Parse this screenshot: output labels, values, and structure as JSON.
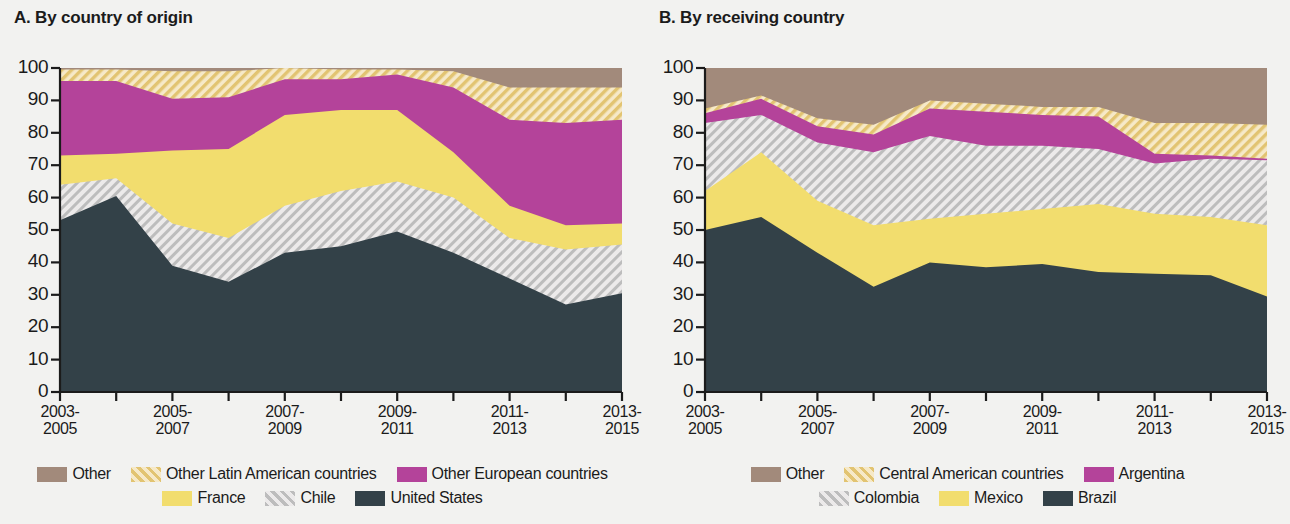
{
  "panels": [
    {
      "id": "A",
      "title": "A. By country of origin",
      "legend_rows": [
        [
          {
            "label": "Other",
            "key": "other"
          },
          {
            "label": "Other Latin American countries",
            "key": "other_latin"
          },
          {
            "label": "Other European countries",
            "key": "other_europe"
          }
        ],
        [
          {
            "label": "France",
            "key": "france"
          },
          {
            "label": "Chile",
            "key": "chile"
          },
          {
            "label": "United States",
            "key": "united_states"
          }
        ]
      ]
    },
    {
      "id": "B",
      "title": "B. By receiving country",
      "legend_rows": [
        [
          {
            "label": "Other",
            "key": "other"
          },
          {
            "label": "Central American countries",
            "key": "central_american"
          },
          {
            "label": "Argentina",
            "key": "argentina"
          }
        ],
        [
          {
            "label": "Colombia",
            "key": "colombia"
          },
          {
            "label": "Mexico",
            "key": "mexico"
          },
          {
            "label": "Brazil",
            "key": "brazil"
          }
        ]
      ]
    }
  ],
  "colors": {
    "brown": "#a28a7b",
    "yellow_hatch_bg": "#f6e9c8",
    "yellow_hatch_line": "#e2c472",
    "magenta": "#b4439a",
    "yellow": "#f2dd6e",
    "gray_hatch_bg": "#eceaea",
    "gray_hatch_line": "#bdbdbd",
    "dark": "#334148",
    "axis": "#1b1b1b",
    "background": "#f2f2f0"
  },
  "axis": {
    "y_ticks": [
      "100",
      "90",
      "80",
      "70",
      "60",
      "50",
      "40",
      "30",
      "20",
      "10",
      "0"
    ],
    "x_labels": [
      "2003-\n2005",
      "2005-\n2007",
      "2007-\n2009",
      "2009-\n2011",
      "2011-\n2013",
      "2013-\n2015"
    ],
    "x_labels_line1": [
      "2003-",
      "2005-",
      "2007-",
      "2009-",
      "2011-",
      "2013-"
    ],
    "x_labels_line2": [
      "2005",
      "2007",
      "2009",
      "2011",
      "2013",
      "2015"
    ],
    "ylim": [
      0,
      100
    ],
    "n_points": 11
  },
  "chart_data": [
    {
      "type": "area",
      "title": "A. By country of origin",
      "xlabel": "",
      "ylabel": "",
      "ylim": [
        0,
        100
      ],
      "grid": false,
      "stacked": true,
      "legend_position": "bottom",
      "categories": [
        "2003-2005",
        "2004-2006",
        "2005-2007",
        "2006-2008",
        "2007-2009",
        "2008-2010",
        "2009-2011",
        "2010-2012",
        "2011-2013",
        "2012-2014",
        "2013-2015"
      ],
      "x_tick_labels": [
        "2003-2005",
        "2005-2007",
        "2007-2009",
        "2009-2011",
        "2011-2013",
        "2013-2015"
      ],
      "series": [
        {
          "name": "United States",
          "key": "united_states",
          "values": [
            53,
            60.5,
            39,
            34,
            43,
            45,
            49.5,
            43,
            35,
            27,
            30.5
          ]
        },
        {
          "name": "Chile",
          "key": "chile",
          "values": [
            11,
            5.5,
            13,
            13.5,
            14.5,
            17,
            15.5,
            17,
            12.5,
            17,
            15
          ]
        },
        {
          "name": "France",
          "key": "france",
          "values": [
            9,
            7.5,
            22.5,
            27.5,
            28,
            25,
            22,
            14,
            10,
            7.5,
            6.5
          ]
        },
        {
          "name": "Other European countries",
          "key": "other_europe",
          "values": [
            23,
            22.5,
            16,
            16,
            11,
            9.5,
            11,
            20,
            26.5,
            31.5,
            32
          ]
        },
        {
          "name": "Other Latin American countries",
          "key": "other_latin",
          "values": [
            3.5,
            3.5,
            8.5,
            8,
            3.5,
            3,
            1.5,
            5,
            10,
            11,
            10
          ]
        },
        {
          "name": "Other",
          "key": "other",
          "values": [
            0.5,
            0.5,
            1,
            1,
            0,
            0.5,
            0.5,
            1,
            6,
            6,
            6
          ]
        }
      ],
      "boundaries_cumulative": {
        "united_states": [
          53,
          60.5,
          39,
          34,
          43,
          45,
          49.5,
          43,
          35,
          27,
          30.5
        ],
        "chile": [
          64,
          66,
          52,
          47.5,
          57.5,
          62,
          65,
          60,
          47.5,
          44,
          45.5
        ],
        "france": [
          73,
          73.5,
          74.5,
          75,
          85.5,
          87,
          87,
          74,
          57.5,
          51.5,
          52
        ],
        "other_europe": [
          96,
          96,
          90.5,
          91,
          96.5,
          96.5,
          98,
          94,
          84,
          83,
          84
        ],
        "other_latin": [
          99.5,
          99.5,
          99,
          99,
          100,
          99.5,
          99.5,
          99,
          94,
          94,
          94
        ],
        "other": [
          100,
          100,
          100,
          100,
          100,
          100,
          100,
          100,
          100,
          100,
          100
        ]
      }
    },
    {
      "type": "area",
      "title": "B. By receiving country",
      "xlabel": "",
      "ylabel": "",
      "ylim": [
        0,
        100
      ],
      "grid": false,
      "stacked": true,
      "legend_position": "bottom",
      "categories": [
        "2003-2005",
        "2004-2006",
        "2005-2007",
        "2006-2008",
        "2007-2009",
        "2008-2010",
        "2009-2011",
        "2010-2012",
        "2011-2013",
        "2012-2014",
        "2013-2015"
      ],
      "x_tick_labels": [
        "2003-2005",
        "2005-2007",
        "2007-2009",
        "2009-2011",
        "2011-2013",
        "2013-2015"
      ],
      "series": [
        {
          "name": "Brazil",
          "key": "brazil",
          "values": [
            50,
            54,
            43,
            32.5,
            40,
            38.5,
            39.5,
            37,
            36.5,
            36,
            29.5
          ]
        },
        {
          "name": "Mexico",
          "key": "mexico",
          "values": [
            12,
            20,
            16,
            19,
            13.5,
            16.5,
            17,
            21,
            18.5,
            18,
            22
          ]
        },
        {
          "name": "Colombia",
          "key": "colombia",
          "values": [
            21,
            11.5,
            18,
            22.5,
            25.5,
            21,
            19.5,
            17,
            15.5,
            18,
            20
          ]
        },
        {
          "name": "Argentina",
          "key": "argentina",
          "values": [
            3,
            5,
            5,
            5.5,
            8.5,
            10.5,
            9.5,
            10,
            3,
            1,
            0.5
          ]
        },
        {
          "name": "Central American countries",
          "key": "central_american",
          "values": [
            1.5,
            1,
            2.5,
            3,
            2.5,
            2.5,
            2.5,
            3,
            9.5,
            10,
            10.5
          ]
        },
        {
          "name": "Other",
          "key": "other",
          "values": [
            12.5,
            8.5,
            15.5,
            17.5,
            10,
            11,
            12,
            12,
            17,
            17,
            17.5
          ]
        }
      ],
      "boundaries_cumulative": {
        "brazil": [
          50,
          54,
          43,
          32.5,
          40,
          38.5,
          39.5,
          37,
          36.5,
          36,
          29.5
        ],
        "mexico": [
          62,
          74,
          59,
          51.5,
          53.5,
          55,
          56.5,
          58,
          55,
          54,
          51.5
        ],
        "colombia": [
          83,
          85.5,
          77,
          74,
          79,
          76,
          76,
          75,
          70.5,
          72,
          71.5
        ],
        "argentina": [
          86,
          90.5,
          82,
          79.5,
          87.5,
          86.5,
          85.5,
          85,
          73.5,
          73,
          72
        ],
        "central_american": [
          87.5,
          91.5,
          84.5,
          82.5,
          90,
          89,
          88,
          88,
          83,
          83,
          82.5
        ],
        "other": [
          100,
          100,
          100,
          100,
          100,
          100,
          100,
          100,
          100,
          100,
          100
        ]
      }
    }
  ]
}
